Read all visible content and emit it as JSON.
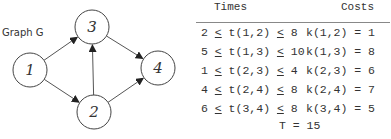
{
  "graph": {
    "label": "Graph G",
    "nodes": [
      {
        "id": "1",
        "x": 30,
        "y": 70
      },
      {
        "id": "2",
        "x": 94,
        "y": 112
      },
      {
        "id": "3",
        "x": 92,
        "y": 27
      },
      {
        "id": "4",
        "x": 158,
        "y": 68
      }
    ],
    "edges": [
      {
        "from": "1",
        "to": "3"
      },
      {
        "from": "1",
        "to": "2"
      },
      {
        "from": "2",
        "to": "3"
      },
      {
        "from": "2",
        "to": "4"
      },
      {
        "from": "3",
        "to": "4"
      }
    ]
  },
  "table": {
    "headers": {
      "times": "Times",
      "costs": "Costs"
    },
    "rows": [
      {
        "lo": "2",
        "var": "t(1,2)",
        "hi": "8",
        "cost": "k(1,2) = 1"
      },
      {
        "lo": "5",
        "var": "t(1,3)",
        "hi": "10",
        "cost": "k(1,3) = 8"
      },
      {
        "lo": "1",
        "var": "t(2,3)",
        "hi": "4",
        "cost": "k(2,3) = 6"
      },
      {
        "lo": "4",
        "var": "t(2,4)",
        "hi": "8",
        "cost": "k(2,4) = 7"
      },
      {
        "lo": "6",
        "var": "t(3,4)",
        "hi": "8",
        "cost": "k(3,4) = 5"
      }
    ],
    "le_symbol": "<",
    "total": "T = 15"
  }
}
